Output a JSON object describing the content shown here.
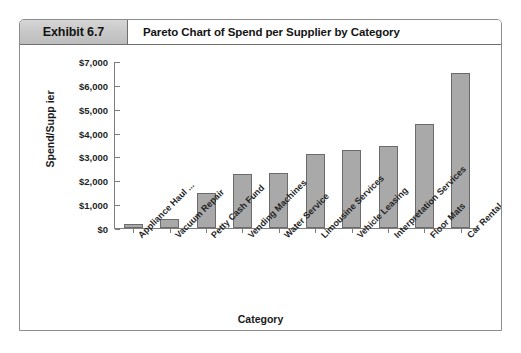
{
  "exhibit": {
    "number_label": "Exhibit 6.7",
    "title": "Pareto Chart of Spend per Supplier by Category"
  },
  "chart_data": {
    "type": "bar",
    "title": "Pareto Chart of Spend per Supplier by Category",
    "xlabel": "Category",
    "ylabel": "Spend/Supp ier",
    "categories": [
      "Appliance Haul ...",
      "Vacuum Repair",
      "Petty Cash Fund",
      "Vending Machines",
      "Water Service",
      "Limousine Services",
      "Vehicle Leasing",
      "Interpretation Services",
      "Floor Mats",
      "Car Rental"
    ],
    "values": [
      150,
      380,
      1480,
      2280,
      2290,
      3100,
      3280,
      3420,
      4350,
      6500
    ],
    "ylim": [
      0,
      7000
    ],
    "ytick_labels": [
      "$7,000",
      "$6,000",
      "$5,000",
      "$4,000",
      "$3,000",
      "$2,000",
      "$1,000",
      "$0"
    ],
    "ytick_values": [
      7000,
      6000,
      5000,
      4000,
      3000,
      2000,
      1000,
      0
    ],
    "grid": false,
    "legend": false,
    "bar_color": "#a9a9a9",
    "bar_border_color": "#6b6b6b",
    "axis_color": "#7d7d7d"
  }
}
